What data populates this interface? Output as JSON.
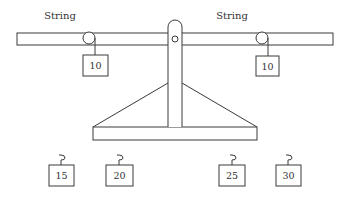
{
  "diagram": {
    "title": "",
    "type": "balance-scale-with-pulleys",
    "labels": {
      "left_string": "String",
      "right_string": "String"
    },
    "hanging_weights": [
      {
        "side": "left",
        "value": "10"
      },
      {
        "side": "right",
        "value": "10"
      }
    ],
    "loose_weights": [
      {
        "value": "15"
      },
      {
        "value": "20"
      },
      {
        "value": "25"
      },
      {
        "value": "30"
      }
    ],
    "colors": {
      "stroke": "#3a3a3a",
      "fill": "#ffffff",
      "text": "#333333"
    }
  }
}
